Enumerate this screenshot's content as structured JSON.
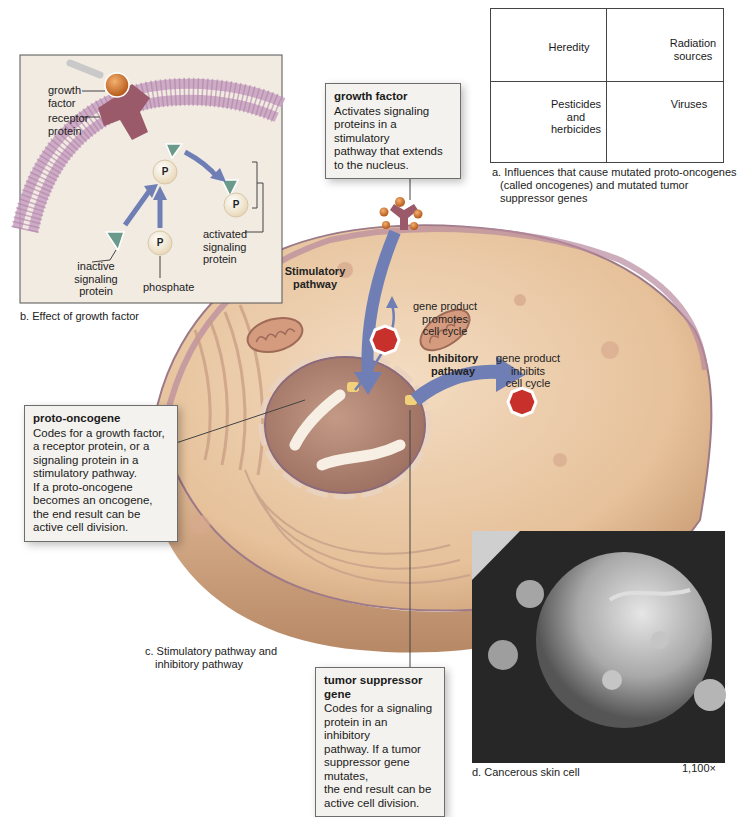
{
  "figure": {
    "panel_a": {
      "caption": "a. Influences that cause mutated proto-oncogenes (called oncogenes) and mutated tumor suppressor genes",
      "caption_lines": [
        "a. Influences that cause mutated proto-oncogenes",
        "(called oncogenes) and mutated tumor",
        "suppressor genes"
      ],
      "cells": [
        {
          "label": "Heredity",
          "icon": "people-silhouette-icon"
        },
        {
          "label_lines": [
            "Radiation",
            "sources"
          ],
          "icon": "radiation-icon"
        },
        {
          "label_lines": [
            "Pesticides",
            "and",
            "herbicides"
          ],
          "icon": "molecule-icon"
        },
        {
          "label": "Viruses",
          "icon": "bacteriophage-icon"
        }
      ]
    },
    "panel_b": {
      "caption": "b. Effect of growth factor",
      "labels": {
        "growth_factor": [
          "growth",
          "factor"
        ],
        "receptor_protein": [
          "receptor",
          "protein"
        ],
        "inactive_signaling_protein": [
          "inactive",
          "signaling",
          "protein"
        ],
        "phosphate": "phosphate",
        "activated_signaling_protein": [
          "activated",
          "signaling",
          "protein"
        ],
        "phosphate_symbol": "P"
      }
    },
    "panel_c": {
      "caption_lines": [
        "c. Stimulatory pathway and",
        "inhibitory pathway"
      ],
      "stimulatory_pathway": [
        "Stimulatory",
        "pathway"
      ],
      "inhibitory_pathway": [
        "Inhibitory",
        "pathway"
      ],
      "gene_product_promotes": [
        "gene product",
        "promotes",
        "cell cycle"
      ],
      "gene_product_inhibits": [
        "gene product",
        "inhibits",
        "cell cycle"
      ]
    },
    "panel_d": {
      "caption": "d. Cancerous skin cell",
      "magnification": "1,100×"
    },
    "callouts": {
      "growth_factor": {
        "title": "growth factor",
        "body_lines": [
          "Activates signaling",
          "proteins in a stimulatory",
          "pathway that extends",
          "to the nucleus."
        ]
      },
      "proto_oncogene": {
        "title": "proto-oncogene",
        "body_lines": [
          "Codes for a growth factor,",
          "a receptor protein, or a",
          "signaling protein in a",
          "stimulatory pathway.",
          "If a proto-oncogene",
          "becomes an oncogene,",
          "the end result can be",
          "active cell division."
        ]
      },
      "tumor_suppressor_gene": {
        "title": "tumor suppressor gene",
        "body_lines": [
          "Codes for a signaling",
          "protein in an inhibitory",
          "pathway. If a tumor",
          "suppressor gene mutates,",
          "the end result can be",
          "active cell division."
        ]
      }
    },
    "colors": {
      "cell_body": "#e9c9a4",
      "cell_membrane": "#b88a9e",
      "nucleus": "#b38c7a",
      "pathway_arrow": "#6f7fb5",
      "octagon": "#c8312b",
      "growth_factor": "#d9802f",
      "receptor": "#9a5a6a",
      "signaling_protein": "#6a9a8a",
      "callout_bg": "#f4f2ee"
    }
  }
}
